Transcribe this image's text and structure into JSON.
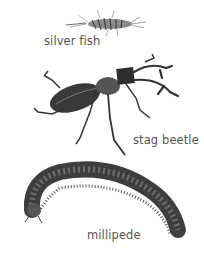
{
  "illustration": {
    "specimens": [
      {
        "name": "silverfish",
        "label": "silver fish"
      },
      {
        "name": "stag-beetle",
        "label": "stag beetle"
      },
      {
        "name": "millipede",
        "label": "millipede"
      }
    ]
  },
  "colors": {
    "background": "#ffffff",
    "label_text": "#555555",
    "body_dark": "#2e2e2e",
    "body_mid": "#6a6a6a"
  }
}
